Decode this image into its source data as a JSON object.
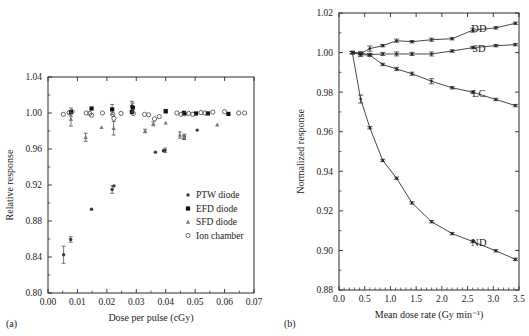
{
  "figure": {
    "panel_a_label": "(a)",
    "panel_b_label": "(b)"
  },
  "chart_data": [
    {
      "type": "scatter",
      "panel": "(a)",
      "title": "",
      "xlabel": "Dose per pulse (cGy)",
      "ylabel": "Relative response",
      "xlim": [
        0.0,
        0.07
      ],
      "ylim": [
        0.8,
        1.04
      ],
      "xticks": [
        "0.00",
        "0.01",
        "0.02",
        "0.03",
        "0.04",
        "0.05",
        "0.06",
        "0.07"
      ],
      "xtick_values": [
        0.0,
        0.01,
        0.02,
        0.03,
        0.04,
        0.05,
        0.06,
        0.07
      ],
      "yticks": [
        "0.80",
        "0.84",
        "0.88",
        "0.92",
        "0.96",
        "1.00",
        "1.04"
      ],
      "ytick_values": [
        0.8,
        0.84,
        0.88,
        0.92,
        0.96,
        1.0,
        1.04
      ],
      "grid": false,
      "legend_position": "lower-right",
      "legend": [
        "PTW diode",
        "EFD diode",
        "SFD diode",
        "Ion chamber"
      ],
      "series": [
        {
          "name": "PTW diode",
          "marker": "filled-circle",
          "points": [
            {
              "x": 0.0053,
              "y": 0.8425,
              "err": 0.0095
            },
            {
              "x": 0.0077,
              "y": 0.8595,
              "err": 0.003
            },
            {
              "x": 0.0148,
              "y": 0.893,
              "err": 0.0
            },
            {
              "x": 0.0218,
              "y": 0.915,
              "err": 0.0042
            },
            {
              "x": 0.0224,
              "y": 0.919,
              "err": 0.0
            },
            {
              "x": 0.0365,
              "y": 0.9565,
              "err": 0.0
            },
            {
              "x": 0.0392,
              "y": 0.958,
              "err": 0.0
            },
            {
              "x": 0.0398,
              "y": 0.9585,
              "err": 0.0025
            },
            {
              "x": 0.0463,
              "y": 0.9735,
              "err": 0.003
            },
            {
              "x": 0.0507,
              "y": 0.981,
              "err": 0.0
            },
            {
              "x": 0.0285,
              "y": 1.0075,
              "err": 0.0055
            }
          ]
        },
        {
          "name": "EFD diode",
          "marker": "filled-square",
          "points": [
            {
              "x": 0.0148,
              "y": 1.005,
              "err": 0.0
            },
            {
              "x": 0.0218,
              "y": 1.004,
              "err": 0.0055
            },
            {
              "x": 0.0285,
              "y": 1.001,
              "err": 0.0
            },
            {
              "x": 0.0288,
              "y": 1.006,
              "err": 0.005
            },
            {
              "x": 0.04,
              "y": 1.002,
              "err": 0.002
            },
            {
              "x": 0.0462,
              "y": 1.0,
              "err": 0.002
            },
            {
              "x": 0.0503,
              "y": 0.9995,
              "err": 0.0
            },
            {
              "x": 0.0543,
              "y": 0.9995,
              "err": 0.0
            },
            {
              "x": 0.0613,
              "y": 0.999,
              "err": 0.0
            },
            {
              "x": 0.0078,
              "y": 1.001,
              "err": 0.0045
            }
          ]
        },
        {
          "name": "SFD diode",
          "marker": "small-triangle",
          "points": [
            {
              "x": 0.0078,
              "y": 0.993,
              "err": 0.0075
            },
            {
              "x": 0.0128,
              "y": 0.973,
              "err": 0.0045
            },
            {
              "x": 0.0182,
              "y": 0.984,
              "err": 0.0
            },
            {
              "x": 0.0223,
              "y": 0.983,
              "err": 0.0075
            },
            {
              "x": 0.033,
              "y": 0.98,
              "err": 0.002
            },
            {
              "x": 0.0358,
              "y": 0.988,
              "err": 0.0022
            },
            {
              "x": 0.04,
              "y": 0.989,
              "err": 0.0
            },
            {
              "x": 0.0448,
              "y": 0.9755,
              "err": 0.0035
            },
            {
              "x": 0.0462,
              "y": 0.973,
              "err": 0.0022
            },
            {
              "x": 0.0575,
              "y": 0.987,
              "err": 0.0
            }
          ]
        },
        {
          "name": "Ion chamber",
          "marker": "open-circle",
          "points": [
            {
              "x": 0.0052,
              "y": 0.9985,
              "err": 0.0
            },
            {
              "x": 0.0072,
              "y": 1.0005,
              "err": 0.0
            },
            {
              "x": 0.0082,
              "y": 1.0015,
              "err": 0.0
            },
            {
              "x": 0.013,
              "y": 1.0,
              "err": 0.0
            },
            {
              "x": 0.0142,
              "y": 0.9995,
              "err": 0.0
            },
            {
              "x": 0.0148,
              "y": 0.9975,
              "err": 0.0
            },
            {
              "x": 0.0185,
              "y": 1.0,
              "err": 0.0
            },
            {
              "x": 0.022,
              "y": 0.9985,
              "err": 0.0
            },
            {
              "x": 0.0224,
              "y": 0.994,
              "err": 0.0
            },
            {
              "x": 0.0248,
              "y": 0.9995,
              "err": 0.0
            },
            {
              "x": 0.029,
              "y": 0.9995,
              "err": 0.0
            },
            {
              "x": 0.0328,
              "y": 0.9985,
              "err": 0.0
            },
            {
              "x": 0.0342,
              "y": 0.998,
              "err": 0.0
            },
            {
              "x": 0.0362,
              "y": 0.9935,
              "err": 0.0
            },
            {
              "x": 0.0378,
              "y": 0.996,
              "err": 0.0
            },
            {
              "x": 0.0438,
              "y": 1.0,
              "err": 0.0
            },
            {
              "x": 0.0452,
              "y": 0.9985,
              "err": 0.0
            },
            {
              "x": 0.0465,
              "y": 0.999,
              "err": 0.0
            },
            {
              "x": 0.0478,
              "y": 0.9995,
              "err": 0.0
            },
            {
              "x": 0.0492,
              "y": 0.9985,
              "err": 0.0
            },
            {
              "x": 0.052,
              "y": 1.0005,
              "err": 0.0
            },
            {
              "x": 0.0533,
              "y": 1.0,
              "err": 0.0
            },
            {
              "x": 0.056,
              "y": 1.001,
              "err": 0.0
            },
            {
              "x": 0.06,
              "y": 1.0015,
              "err": 0.0
            },
            {
              "x": 0.0648,
              "y": 1.0,
              "err": 0.0
            },
            {
              "x": 0.0668,
              "y": 1.0,
              "err": 0.0
            }
          ]
        }
      ]
    },
    {
      "type": "line",
      "panel": "(b)",
      "title": "",
      "xlabel": "Mean dose rate (Gy min⁻¹)",
      "ylabel": "Normalized response",
      "xlim": [
        0.0,
        3.5
      ],
      "ylim": [
        0.88,
        1.02
      ],
      "xticks": [
        "0.0",
        "0.5",
        "1.0",
        "1.5",
        "2.0",
        "2.5",
        "3.0",
        "3.5"
      ],
      "xtick_values": [
        0.0,
        0.5,
        1.0,
        1.5,
        2.0,
        2.5,
        3.0,
        3.5
      ],
      "yticks": [
        "0.88",
        "0.90",
        "0.92",
        "0.94",
        "0.96",
        "0.98",
        "1.00",
        "1.02"
      ],
      "ytick_values": [
        0.88,
        0.9,
        0.92,
        0.94,
        0.96,
        0.98,
        1.0,
        1.02
      ],
      "grid": false,
      "legend_position": "inline-annotations",
      "series": [
        {
          "name": "DD",
          "label": "DD",
          "label_x": 2.72,
          "label_y": 1.0105,
          "x": [
            0.26,
            0.42,
            0.6,
            0.85,
            1.12,
            1.42,
            1.8,
            2.2,
            2.6,
            3.05,
            3.43
          ],
          "y": [
            1.0,
            0.9995,
            1.002,
            1.0035,
            1.006,
            1.0055,
            1.0065,
            1.007,
            1.0113,
            1.0125,
            1.0148
          ],
          "err": [
            0.0006,
            0.0008,
            0.0013,
            0.0006,
            0.0008,
            0.0006,
            0.0008,
            0.0006,
            0.001,
            0.0006,
            0.0006
          ]
        },
        {
          "name": "SD",
          "label": "SD",
          "label_x": 2.72,
          "label_y": 1.0003,
          "x": [
            0.26,
            0.42,
            0.6,
            0.85,
            1.12,
            1.42,
            1.8,
            2.2,
            2.6,
            3.05,
            3.43
          ],
          "y": [
            1.0,
            0.9997,
            0.999,
            0.9993,
            0.9993,
            0.9993,
            0.9993,
            1.0008,
            1.0025,
            1.0035,
            1.004
          ],
          "err": [
            0.0006,
            0.0006,
            0.0006,
            0.0008,
            0.001,
            0.0008,
            0.001,
            0.0006,
            0.0006,
            0.0006,
            0.0006
          ]
        },
        {
          "name": "LC",
          "label": "LC",
          "label_x": 2.72,
          "label_y": 0.9775,
          "x": [
            0.26,
            0.42,
            0.6,
            0.85,
            1.12,
            1.42,
            1.8,
            2.2,
            2.6,
            3.05,
            3.43
          ],
          "y": [
            1.0,
            0.999,
            0.9987,
            0.994,
            0.9917,
            0.9893,
            0.9855,
            0.9822,
            0.98,
            0.9763,
            0.9732
          ],
          "err": [
            0.0006,
            0.001,
            0.0006,
            0.0006,
            0.0008,
            0.0008,
            0.0013,
            0.0006,
            0.0006,
            0.0006,
            0.0006
          ]
        },
        {
          "name": "ND",
          "label": "ND",
          "label_x": 2.72,
          "label_y": 0.902,
          "x": [
            0.26,
            0.42,
            0.6,
            0.85,
            1.12,
            1.42,
            1.8,
            2.2,
            2.6,
            3.05,
            3.43
          ],
          "y": [
            1.0,
            0.9765,
            0.962,
            0.9455,
            0.9365,
            0.924,
            0.9145,
            0.9085,
            0.9045,
            0.8998,
            0.8955
          ],
          "err": [
            0.0006,
            0.002,
            0.0006,
            0.0006,
            0.0006,
            0.0006,
            0.0006,
            0.0006,
            0.0006,
            0.0006,
            0.0006
          ]
        }
      ]
    }
  ]
}
